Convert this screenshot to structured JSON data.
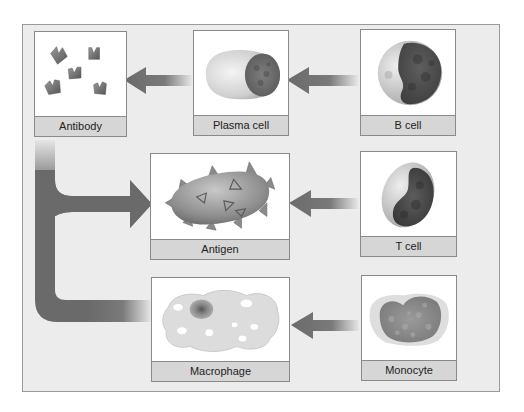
{
  "diagram": {
    "nodes": [
      {
        "id": "antibody",
        "label": "Antibody",
        "icon": "antibody-icon"
      },
      {
        "id": "plasma_cell",
        "label": "Plasma cell",
        "icon": "plasma-cell-icon"
      },
      {
        "id": "b_cell",
        "label": "B cell",
        "icon": "b-cell-icon"
      },
      {
        "id": "antigen",
        "label": "Antigen",
        "icon": "antigen-icon"
      },
      {
        "id": "t_cell",
        "label": "T cell",
        "icon": "t-cell-icon"
      },
      {
        "id": "macrophage",
        "label": "Macrophage",
        "icon": "macrophage-icon"
      },
      {
        "id": "monocyte",
        "label": "Monocyte",
        "icon": "monocyte-icon"
      }
    ],
    "edges": [
      {
        "from": "b_cell",
        "to": "plasma_cell"
      },
      {
        "from": "plasma_cell",
        "to": "antibody"
      },
      {
        "from": "t_cell",
        "to": "antigen"
      },
      {
        "from": "monocyte",
        "to": "macrophage"
      },
      {
        "from": "antibody",
        "to": "antigen"
      },
      {
        "from": "macrophage",
        "to": "antigen"
      }
    ],
    "colors": {
      "panel_bg": "#ececec",
      "box_bg": "#ffffff",
      "label_bg": "#d6d6d6",
      "arrow": "#6e6e6e",
      "border": "#8a8a8a"
    }
  }
}
